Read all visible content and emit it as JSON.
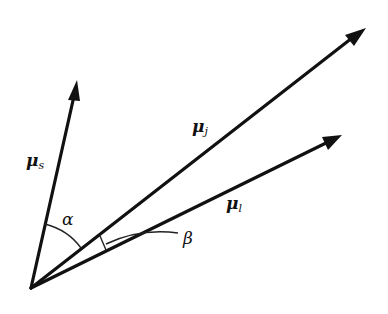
{
  "diagram": {
    "type": "vector-angle-diagram",
    "vectors": [
      {
        "id": "mu_s",
        "symbol": "μ",
        "subscript": "s"
      },
      {
        "id": "mu_j",
        "symbol": "μ",
        "subscript": "j"
      },
      {
        "id": "mu_l",
        "symbol": "μ",
        "subscript": "l"
      }
    ],
    "angles": [
      {
        "id": "alpha",
        "symbol": "α",
        "between": [
          "mu_s",
          "mu_j"
        ]
      },
      {
        "id": "beta",
        "symbol": "β",
        "between": [
          "mu_j",
          "mu_l"
        ]
      }
    ],
    "colors": {
      "ink": "#111111",
      "background": "#ffffff"
    }
  }
}
